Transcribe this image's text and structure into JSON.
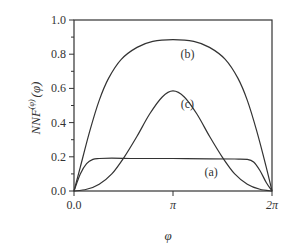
{
  "chart_data": {
    "type": "line",
    "title": "",
    "xlabel": "φ",
    "ylabel": "NNF",
    "ylabel_superscript": "(φ)",
    "ylabel_suffix": "(φ)",
    "xlim": [
      0,
      6.2832
    ],
    "ylim": [
      0,
      1.0
    ],
    "x_ticks": [
      {
        "value": 0,
        "label": "0.0"
      },
      {
        "value": 3.1416,
        "label": "π"
      },
      {
        "value": 6.2832,
        "label": "2π"
      }
    ],
    "y_ticks": [
      {
        "value": 0.0,
        "label": "0.0"
      },
      {
        "value": 0.2,
        "label": "0.2"
      },
      {
        "value": 0.4,
        "label": "0.4"
      },
      {
        "value": 0.6,
        "label": "0.6"
      },
      {
        "value": 0.8,
        "label": "0.8"
      },
      {
        "value": 1.0,
        "label": "1.0"
      }
    ],
    "y_minor_step": 0.1,
    "grid": false,
    "legend": "none",
    "series": [
      {
        "name": "(a)",
        "label_position": {
          "x": 4.35,
          "y": 0.11
        },
        "x": [
          0,
          0.2,
          0.4,
          0.6,
          0.8,
          1.2,
          2.0,
          3.1416,
          4.3,
          5.1,
          5.5,
          5.7,
          5.9,
          6.1,
          6.2832
        ],
        "y": [
          0,
          0.1,
          0.16,
          0.185,
          0.19,
          0.192,
          0.19,
          0.19,
          0.188,
          0.187,
          0.185,
          0.17,
          0.12,
          0.05,
          0
        ]
      },
      {
        "name": "(b)",
        "label_position": {
          "x": 3.6,
          "y": 0.8
        },
        "x": [
          0,
          0.2,
          0.5,
          0.8,
          1.1,
          1.5,
          2.0,
          2.5,
          3.1416,
          3.8,
          4.3,
          4.8,
          5.2,
          5.5,
          5.8,
          6.1,
          6.2832
        ],
        "y": [
          0,
          0.14,
          0.35,
          0.53,
          0.66,
          0.77,
          0.84,
          0.875,
          0.885,
          0.875,
          0.84,
          0.77,
          0.66,
          0.53,
          0.35,
          0.14,
          0
        ]
      },
      {
        "name": "(c)",
        "label_position": {
          "x": 3.6,
          "y": 0.51
        },
        "x": [
          0,
          0.4,
          0.8,
          1.2,
          1.6,
          2.0,
          2.4,
          2.8,
          3.1416,
          3.5,
          3.9,
          4.3,
          4.7,
          5.1,
          5.5,
          5.9,
          6.2832
        ],
        "y": [
          0,
          0.01,
          0.04,
          0.1,
          0.2,
          0.32,
          0.45,
          0.55,
          0.585,
          0.55,
          0.45,
          0.32,
          0.2,
          0.1,
          0.04,
          0.01,
          0
        ]
      }
    ]
  }
}
